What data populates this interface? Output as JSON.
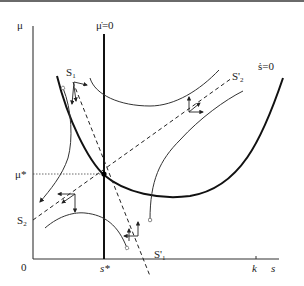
{
  "diagram": {
    "type": "phase-diagram",
    "axes": {
      "y_label": "μ",
      "x_label": "s",
      "origin_label": "0",
      "x_ticks": [
        {
          "label": "s*",
          "role": "steady-state s"
        },
        {
          "label": "k",
          "role": "upper bound"
        }
      ],
      "y_ticks": [
        {
          "label": "μ*",
          "role": "steady-state μ"
        },
        {
          "label": "S₂",
          "role": "stable arm intercept"
        }
      ]
    },
    "isoclines": [
      {
        "label": "μ̇=0",
        "shape": "vertical line at s*"
      },
      {
        "label": "ṡ=0",
        "shape": "U-shaped curve"
      }
    ],
    "separatrices": [
      {
        "label": "S₁",
        "end_label": "S'₁",
        "direction": "downward sloping, dashed"
      },
      {
        "label": "S₂",
        "end_label": "S'₂",
        "direction": "upward sloping, dashed"
      }
    ],
    "equilibrium": {
      "label": "(s*, μ*)",
      "type": "saddle point"
    },
    "labels": {
      "mu": "μ",
      "mu_dot_zero": "μ̇=0",
      "s_dot_zero": "ṡ=0",
      "S1": "S",
      "S1_sub": "1",
      "S1p": "S'",
      "S1p_sub": "1",
      "S2": "S",
      "S2_sub": "2",
      "S2p": "S'",
      "S2p_sub": "2",
      "mu_star": "μ*",
      "s_star": "s*",
      "zero": "0",
      "k": "k",
      "s": "s"
    }
  }
}
